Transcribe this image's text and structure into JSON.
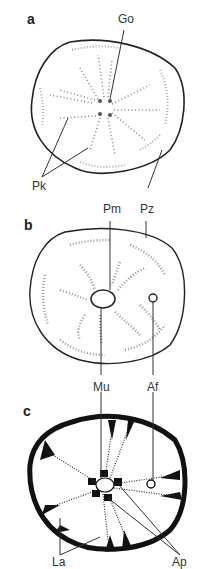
{
  "figure": {
    "panels": [
      {
        "letter": "a",
        "labels": {
          "go": "Go",
          "pk": "Pk",
          "pz": "Pz"
        }
      },
      {
        "letter": "b",
        "labels": {
          "pm": "Pm",
          "pz": "Pz",
          "mu": "Mu",
          "af": "Af"
        }
      },
      {
        "letter": "c",
        "labels": {
          "mu": "Mu",
          "af": "Af",
          "la": "La",
          "ap": "Ap"
        }
      }
    ]
  },
  "colors": {
    "ink": "#1a1a1a",
    "stipple": "#777777"
  }
}
